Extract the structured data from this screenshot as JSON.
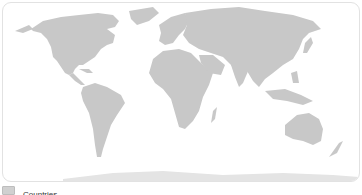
{
  "map": {
    "projection": "equirectangular",
    "land_color": "#c8c8c8",
    "ocean_color": "#ffffff",
    "border_color": "#e2e2e2"
  },
  "legend": {
    "items": [
      {
        "label": "Countries",
        "color": "#d0d0d0"
      }
    ]
  }
}
